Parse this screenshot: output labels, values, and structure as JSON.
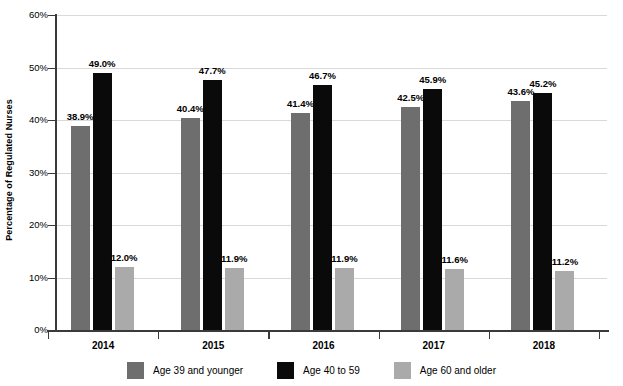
{
  "chart_data": {
    "type": "bar",
    "title": "",
    "subtitle": "",
    "xlabel": "",
    "ylabel": "Percentage of Regulated Nurses",
    "categories": [
      "2014",
      "2015",
      "2016",
      "2017",
      "2018"
    ],
    "ylim": [
      0,
      60
    ],
    "ytick_values": [
      0,
      10,
      20,
      30,
      40,
      50,
      60
    ],
    "ytick_labels": [
      "0%",
      "10%",
      "20%",
      "30%",
      "40%",
      "50%",
      "60%"
    ],
    "grid": true,
    "legend_position": "bottom",
    "series": [
      {
        "name": "Age 39 and younger",
        "color": "#6e6e6e",
        "values": [
          38.9,
          40.4,
          41.4,
          42.5,
          43.6
        ],
        "labels": [
          "38.9%",
          "40.4%",
          "41.4%",
          "42.5%",
          "43.6%"
        ]
      },
      {
        "name": "Age 40 to 59",
        "color": "#0a0a0a",
        "values": [
          49.0,
          47.7,
          46.7,
          45.9,
          45.2
        ],
        "labels": [
          "49.0%",
          "47.7%",
          "46.7%",
          "45.9%",
          "45.2%"
        ]
      },
      {
        "name": "Age 60 and older",
        "color": "#aaaaaa",
        "values": [
          12.0,
          11.9,
          11.9,
          11.6,
          11.2
        ],
        "labels": [
          "12.0%",
          "11.9%",
          "11.9%",
          "11.6%",
          "11.2%"
        ]
      }
    ]
  },
  "axis": {
    "y_title": "Percentage of Regulated Nurses"
  },
  "colors": {
    "series1": "#6e6e6e",
    "series2": "#0a0a0a",
    "series3": "#aaaaaa",
    "gridline": "#d9d9d9",
    "axis": "#3a3a3a",
    "background": "#ffffff"
  }
}
